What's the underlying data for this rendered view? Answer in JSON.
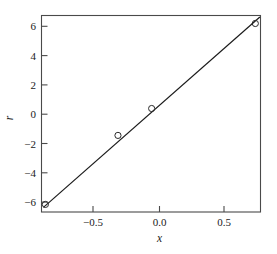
{
  "chart_data": {
    "type": "scatter",
    "title": "",
    "xlabel": "x",
    "ylabel": "r",
    "xlim": [
      -0.905,
      0.785
    ],
    "ylim": [
      -6.72,
      6.8
    ],
    "grid": false,
    "legend": null,
    "x_ticks": [
      -0.5,
      0.0,
      0.5
    ],
    "x_tick_labels": [
      "−0.5",
      "0.0",
      "0.5"
    ],
    "y_ticks": [
      -6,
      -4,
      -2,
      0,
      2,
      4,
      6
    ],
    "y_tick_labels": [
      "−6",
      "−4",
      "−2",
      "0",
      "2",
      "4",
      "6"
    ],
    "series": [
      {
        "name": "observations",
        "marker": "open-circle",
        "x": [
          -0.875,
          -0.315,
          -0.055,
          0.745
        ],
        "y": [
          -6.2,
          -1.45,
          0.4,
          6.25
        ]
      },
      {
        "name": "fitted-line",
        "type": "line",
        "x": [
          -0.89,
          0.78
        ],
        "y": [
          -6.4,
          6.7
        ]
      }
    ]
  },
  "figure": {
    "label_x": "x",
    "label_y": "r"
  }
}
